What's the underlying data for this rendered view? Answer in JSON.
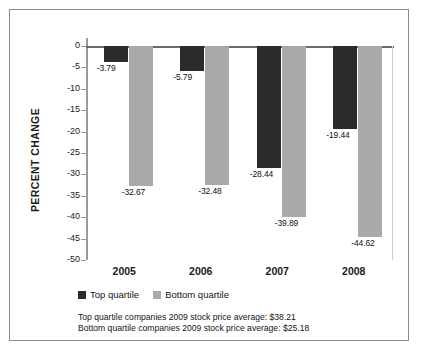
{
  "chart_data": {
    "type": "bar",
    "title": "",
    "xlabel": "",
    "ylabel": "PERCENT CHANGE",
    "categories": [
      "2005",
      "2006",
      "2007",
      "2008"
    ],
    "ylim": [
      -50,
      0
    ],
    "yticks": [
      0,
      -5,
      -10,
      -15,
      -20,
      -25,
      -30,
      -35,
      -40,
      -45,
      -50
    ],
    "ytick_labels": [
      "0",
      "-5",
      "-10",
      "-15",
      "-20",
      "-25",
      "-30",
      "-35",
      "-40",
      "-45",
      "-50"
    ],
    "grid": false,
    "legend_position": "below-plot",
    "series": [
      {
        "name": "Top quartile",
        "color": "#2b2b2b",
        "values": [
          -3.79,
          -5.79,
          -28.44,
          -19.44
        ],
        "value_labels": [
          "-3.79",
          "-5.79",
          "-28.44",
          "-19.44"
        ]
      },
      {
        "name": "Bottom quartile",
        "color": "#a9a9a9",
        "values": [
          -32.67,
          -32.48,
          -39.89,
          -44.62
        ],
        "value_labels": [
          "-32.67",
          "-32.48",
          "-39.89",
          "-44.62"
        ]
      }
    ],
    "annotations": [
      "Top quartile companies 2009 stock price average: $38.21",
      "Bottom quartile companies 2009 stock price average: $25.18"
    ]
  },
  "legend": {
    "items": [
      {
        "label": "Top quartile",
        "color": "#2b2b2b"
      },
      {
        "label": "Bottom quartile",
        "color": "#a9a9a9"
      }
    ]
  },
  "footnote": {
    "line1": "Top quartile companies 2009 stock price average: $38.21",
    "line2": "Bottom quartile companies 2009 stock price average: $25.18"
  },
  "colors": {
    "top_quartile": "#2b2b2b",
    "bottom_quartile": "#a9a9a9",
    "frame": "#8c8c8c",
    "axis": "#9a9a9a",
    "text": "#141414"
  }
}
